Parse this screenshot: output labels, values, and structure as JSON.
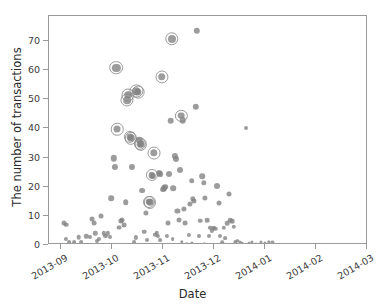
{
  "chart_data": {
    "type": "scatter",
    "title": "",
    "xlabel": "Date",
    "ylabel": "The number of transactions",
    "xtick_labels": [
      "2013-09",
      "2013-10",
      "2013-11",
      "2013-12",
      "2014-01",
      "2014-02",
      "2014-03"
    ],
    "ytick_labels": [
      "0",
      "10",
      "20",
      "30",
      "40",
      "50",
      "60",
      "70"
    ],
    "ylim": [
      -2.5,
      77
    ],
    "xlim": [
      "2013-08-22",
      "2014-03-08"
    ],
    "grid": false,
    "legend": null,
    "marker_color": "#808080",
    "highlight_ring_color": "#8a8a8a",
    "frame_color": "#9a9a9a",
    "series": [
      {
        "name": "transactions",
        "note": "x = days since 2013-09-01 axis tick; y = number of transactions; s = marker pixel diameter; ring = highlighted point",
        "points": [
          {
            "x": 2.0,
            "y": 7.6,
            "s": 5.0,
            "ring": false
          },
          {
            "x": 3.2,
            "y": 7.0,
            "s": 4.6,
            "ring": false
          },
          {
            "x": 3.0,
            "y": 2.0,
            "s": 4.2,
            "ring": false
          },
          {
            "x": 4.6,
            "y": 1.0,
            "s": 3.8,
            "ring": false
          },
          {
            "x": 8.0,
            "y": 1.0,
            "s": 3.8,
            "ring": false
          },
          {
            "x": 10.5,
            "y": 2.6,
            "s": 4.6,
            "ring": false
          },
          {
            "x": 12.0,
            "y": 1.0,
            "s": 3.8,
            "ring": false
          },
          {
            "x": 15.0,
            "y": 3.0,
            "s": 4.4,
            "ring": false
          },
          {
            "x": 17.0,
            "y": 2.6,
            "s": 4.0,
            "ring": false
          },
          {
            "x": 18.5,
            "y": 9.0,
            "s": 5.0,
            "ring": false
          },
          {
            "x": 19.5,
            "y": 7.6,
            "s": 4.8,
            "ring": false
          },
          {
            "x": 20.5,
            "y": 4.0,
            "s": 4.4,
            "ring": false
          },
          {
            "x": 21.5,
            "y": 1.3,
            "s": 4.0,
            "ring": false
          },
          {
            "x": 22.5,
            "y": 2.0,
            "s": 4.0,
            "ring": false
          },
          {
            "x": 24.0,
            "y": 10.0,
            "s": 5.0,
            "ring": false
          },
          {
            "x": 25.5,
            "y": 4.0,
            "s": 4.4,
            "ring": false
          },
          {
            "x": 26.5,
            "y": 3.0,
            "s": 4.2,
            "ring": false
          },
          {
            "x": 28.0,
            "y": 4.0,
            "s": 4.4,
            "ring": false
          },
          {
            "x": 29.0,
            "y": 2.6,
            "s": 4.0,
            "ring": false
          },
          {
            "x": 30.0,
            "y": 16.0,
            "s": 5.6,
            "ring": false
          },
          {
            "x": 31.5,
            "y": 29.8,
            "s": 6.4,
            "ring": false
          },
          {
            "x": 32.0,
            "y": 26.7,
            "s": 6.2,
            "ring": false
          },
          {
            "x": 33.0,
            "y": 60.9,
            "s": 8.2,
            "ring": true
          },
          {
            "x": 33.5,
            "y": 39.8,
            "s": 7.0,
            "ring": true
          },
          {
            "x": 34.5,
            "y": 6.0,
            "s": 4.8,
            "ring": false
          },
          {
            "x": 35.5,
            "y": 8.2,
            "s": 5.2,
            "ring": false
          },
          {
            "x": 36.5,
            "y": 8.6,
            "s": 5.0,
            "ring": false
          },
          {
            "x": 37.5,
            "y": 6.7,
            "s": 4.8,
            "ring": false
          },
          {
            "x": 38.5,
            "y": 14.7,
            "s": 5.6,
            "ring": false
          },
          {
            "x": 39.5,
            "y": 49.7,
            "s": 7.6,
            "ring": true
          },
          {
            "x": 40.0,
            "y": 51.6,
            "s": 7.6,
            "ring": true
          },
          {
            "x": 41.0,
            "y": 37.1,
            "s": 6.8,
            "ring": true
          },
          {
            "x": 41.8,
            "y": 36.6,
            "s": 6.8,
            "ring": true
          },
          {
            "x": 42.5,
            "y": 26.8,
            "s": 6.2,
            "ring": false
          },
          {
            "x": 43.5,
            "y": 1.0,
            "s": 3.8,
            "ring": false
          },
          {
            "x": 44.5,
            "y": 2.6,
            "s": 4.2,
            "ring": false
          },
          {
            "x": 45.0,
            "y": 52.8,
            "s": 7.6,
            "ring": true
          },
          {
            "x": 45.8,
            "y": 52.5,
            "s": 7.2,
            "ring": true
          },
          {
            "x": 46.5,
            "y": 36.2,
            "s": 6.6,
            "ring": false
          },
          {
            "x": 47.2,
            "y": 34.6,
            "s": 6.8,
            "ring": true
          },
          {
            "x": 47.8,
            "y": 34.5,
            "s": 6.8,
            "ring": true
          },
          {
            "x": 48.5,
            "y": 18.7,
            "s": 5.8,
            "ring": false
          },
          {
            "x": 49.5,
            "y": 4.6,
            "s": 4.6,
            "ring": false
          },
          {
            "x": 50.5,
            "y": 11.0,
            "s": 5.2,
            "ring": false
          },
          {
            "x": 51.5,
            "y": 1.6,
            "s": 4.0,
            "ring": false
          },
          {
            "x": 52.5,
            "y": 14.8,
            "s": 6.6,
            "ring": true
          },
          {
            "x": 53.2,
            "y": 14.6,
            "s": 6.6,
            "ring": true
          },
          {
            "x": 54.0,
            "y": 23.9,
            "s": 6.6,
            "ring": true
          },
          {
            "x": 54.8,
            "y": 23.7,
            "s": 6.2,
            "ring": false
          },
          {
            "x": 55.5,
            "y": 31.6,
            "s": 7.4,
            "ring": true
          },
          {
            "x": 56.2,
            "y": 3.6,
            "s": 4.4,
            "ring": false
          },
          {
            "x": 57.0,
            "y": 4.2,
            "s": 4.4,
            "ring": false
          },
          {
            "x": 57.8,
            "y": 3.0,
            "s": 4.2,
            "ring": false
          },
          {
            "x": 58.5,
            "y": 24.7,
            "s": 6.0,
            "ring": false
          },
          {
            "x": 59.2,
            "y": 24.2,
            "s": 5.8,
            "ring": false
          },
          {
            "x": 60.0,
            "y": 57.7,
            "s": 7.6,
            "ring": true
          },
          {
            "x": 60.8,
            "y": 19.0,
            "s": 5.8,
            "ring": false
          },
          {
            "x": 61.5,
            "y": 19.4,
            "s": 5.8,
            "ring": false
          },
          {
            "x": 62.2,
            "y": 20.0,
            "s": 5.6,
            "ring": false
          },
          {
            "x": 63.0,
            "y": 3.0,
            "s": 4.2,
            "ring": false
          },
          {
            "x": 63.8,
            "y": 7.6,
            "s": 5.0,
            "ring": false
          },
          {
            "x": 64.5,
            "y": 24.5,
            "s": 6.0,
            "ring": false
          },
          {
            "x": 65.3,
            "y": 42.6,
            "s": 6.6,
            "ring": false
          },
          {
            "x": 66.0,
            "y": 70.7,
            "s": 8.0,
            "ring": true
          },
          {
            "x": 67.0,
            "y": 19.5,
            "s": 5.6,
            "ring": false
          },
          {
            "x": 68.0,
            "y": 30.6,
            "s": 6.2,
            "ring": false
          },
          {
            "x": 68.6,
            "y": 29.6,
            "s": 6.0,
            "ring": false
          },
          {
            "x": 69.4,
            "y": 11.8,
            "s": 5.2,
            "ring": false
          },
          {
            "x": 70.2,
            "y": 8.6,
            "s": 5.0,
            "ring": false
          },
          {
            "x": 71.0,
            "y": 25.6,
            "s": 6.0,
            "ring": false
          },
          {
            "x": 71.8,
            "y": 44.4,
            "s": 6.8,
            "ring": true
          },
          {
            "x": 72.6,
            "y": 42.8,
            "s": 6.6,
            "ring": false
          },
          {
            "x": 73.4,
            "y": 12.4,
            "s": 5.2,
            "ring": false
          },
          {
            "x": 74.2,
            "y": 7.6,
            "s": 4.8,
            "ring": false
          },
          {
            "x": 75.0,
            "y": 0.5,
            "s": 3.6,
            "ring": false
          },
          {
            "x": 76.0,
            "y": 3.6,
            "s": 4.2,
            "ring": false
          },
          {
            "x": 77.0,
            "y": 14.0,
            "s": 5.2,
            "ring": false
          },
          {
            "x": 77.8,
            "y": 22.0,
            "s": 5.6,
            "ring": false
          },
          {
            "x": 78.6,
            "y": 15.8,
            "s": 5.4,
            "ring": false
          },
          {
            "x": 79.4,
            "y": 15.2,
            "s": 5.2,
            "ring": false
          },
          {
            "x": 80.2,
            "y": 47.4,
            "s": 6.4,
            "ring": false
          },
          {
            "x": 81.0,
            "y": 73.5,
            "s": 6.4,
            "ring": false
          },
          {
            "x": 82.0,
            "y": 3.0,
            "s": 4.0,
            "ring": false
          },
          {
            "x": 83.0,
            "y": 8.3,
            "s": 4.6,
            "ring": false
          },
          {
            "x": 84.0,
            "y": 23.6,
            "s": 5.6,
            "ring": false
          },
          {
            "x": 85.0,
            "y": 21.4,
            "s": 5.4,
            "ring": false
          },
          {
            "x": 86.0,
            "y": 16.2,
            "s": 5.2,
            "ring": false
          },
          {
            "x": 87.0,
            "y": 8.6,
            "s": 4.6,
            "ring": false
          },
          {
            "x": 88.0,
            "y": 3.0,
            "s": 4.0,
            "ring": false
          },
          {
            "x": 89.0,
            "y": 5.8,
            "s": 4.4,
            "ring": false
          },
          {
            "x": 90.0,
            "y": 5.0,
            "s": 4.2,
            "ring": false
          },
          {
            "x": 91.0,
            "y": 6.0,
            "s": 4.4,
            "ring": false
          },
          {
            "x": 92.0,
            "y": 5.6,
            "s": 4.4,
            "ring": false
          },
          {
            "x": 93.0,
            "y": 20.4,
            "s": 6.0,
            "ring": false
          },
          {
            "x": 94.0,
            "y": 14.4,
            "s": 5.0,
            "ring": false
          },
          {
            "x": 95.0,
            "y": 3.0,
            "s": 4.0,
            "ring": false
          },
          {
            "x": 96.0,
            "y": 1.0,
            "s": 3.6,
            "ring": false
          },
          {
            "x": 97.0,
            "y": 5.8,
            "s": 4.4,
            "ring": false
          },
          {
            "x": 98.0,
            "y": 2.4,
            "s": 3.8,
            "ring": false
          },
          {
            "x": 99.0,
            "y": 7.4,
            "s": 4.6,
            "ring": false
          },
          {
            "x": 100.0,
            "y": 17.6,
            "s": 5.0,
            "ring": false
          },
          {
            "x": 101.0,
            "y": 8.6,
            "s": 4.6,
            "ring": false
          },
          {
            "x": 102.0,
            "y": 8.2,
            "s": 4.6,
            "ring": false
          },
          {
            "x": 103.0,
            "y": 6.2,
            "s": 4.4,
            "ring": false
          },
          {
            "x": 104.0,
            "y": 1.0,
            "s": 3.4,
            "ring": false
          },
          {
            "x": 105.0,
            "y": 1.4,
            "s": 3.4,
            "ring": false
          },
          {
            "x": 106.5,
            "y": 1.0,
            "s": 3.2,
            "ring": false
          },
          {
            "x": 108.0,
            "y": 0.6,
            "s": 3.2,
            "ring": false
          },
          {
            "x": 110.0,
            "y": 40.3,
            "s": 4.0,
            "ring": false
          },
          {
            "x": 112.0,
            "y": 0.6,
            "s": 3.0,
            "ring": false
          },
          {
            "x": 114.0,
            "y": 1.0,
            "s": 3.2,
            "ring": false
          },
          {
            "x": 116.0,
            "y": 0.5,
            "s": 3.0,
            "ring": false
          },
          {
            "x": 119.0,
            "y": 1.0,
            "s": 3.2,
            "ring": false
          },
          {
            "x": 121.5,
            "y": 0.6,
            "s": 3.0,
            "ring": false
          },
          {
            "x": 124.0,
            "y": 1.2,
            "s": 3.4,
            "ring": false
          },
          {
            "x": 126.0,
            "y": 1.0,
            "s": 3.2,
            "ring": false
          },
          {
            "x": 85.5,
            "y": 0.5,
            "s": 3.2,
            "ring": false
          },
          {
            "x": 78.0,
            "y": 0.6,
            "s": 3.2,
            "ring": false
          },
          {
            "x": 72.0,
            "y": 1.0,
            "s": 3.4,
            "ring": false
          },
          {
            "x": 66.5,
            "y": 2.0,
            "s": 3.8,
            "ring": false
          },
          {
            "x": 59.0,
            "y": 1.6,
            "s": 3.8,
            "ring": false
          }
        ]
      }
    ]
  }
}
